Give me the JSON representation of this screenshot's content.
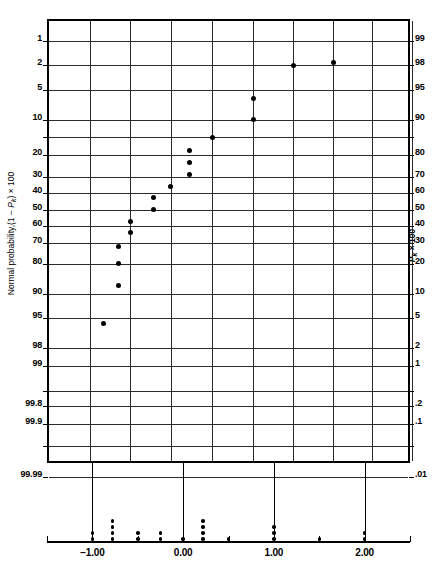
{
  "chart_data": {
    "type": "scatter",
    "title": "",
    "subtitle": "",
    "xlabel": "",
    "ylabel": "Normal probability,(1 − Pk) × 100",
    "ylabel_right": "Pk × 100",
    "grid": true,
    "legend": null,
    "xlim": [
      -1.5,
      2.5
    ],
    "x_ticks_major": [
      -1.0,
      0.0,
      1.0,
      2.0
    ],
    "x_ticks_major_labels": [
      "−1.00",
      "0.00",
      "1.00",
      "2.00"
    ],
    "x_ticks_minor": [
      -1.5,
      -0.5,
      0.5,
      1.5,
      2.5
    ],
    "y_axis_type": "normal-probability",
    "y_ticks_left": [
      "1",
      "2",
      "5",
      "10",
      "20",
      "30",
      "40",
      "50",
      "60",
      "70",
      "80",
      "90",
      "95",
      "98",
      "99",
      "99.8",
      "99.9",
      "99.99"
    ],
    "y_ticks_right": [
      "99",
      "98",
      "95",
      "90",
      "80",
      "70",
      "60",
      "50",
      "40",
      "30",
      "20",
      "10",
      "5",
      "2",
      "1",
      ".2",
      ".1",
      ".01"
    ],
    "points": [
      {
        "x": -1.15,
        "y_left": 97.0,
        "px": 101,
        "py": 321
      },
      {
        "x": -0.78,
        "y_left": 92.0,
        "px": 116,
        "py": 283
      },
      {
        "x": -0.78,
        "y_left": 85.0,
        "px": 116,
        "py": 261
      },
      {
        "x": -0.78,
        "y_left": 81.5,
        "px": 116,
        "py": 244
      },
      {
        "x": -0.5,
        "y_left": 77.0,
        "px": 128,
        "py": 230
      },
      {
        "x": -0.5,
        "y_left": 72.5,
        "px": 128,
        "py": 219
      },
      {
        "x": -0.36,
        "y_left": 69.0,
        "px": 151,
        "py": 207
      },
      {
        "x": -0.36,
        "y_left": 62.0,
        "px": 151,
        "py": 195
      },
      {
        "x": -0.22,
        "y_left": 55.0,
        "px": 168,
        "py": 184
      },
      {
        "x": 0.0,
        "y_left": 48.0,
        "px": 187,
        "py": 172
      },
      {
        "x": 0.18,
        "y_left": 41.0,
        "px": 187,
        "py": 160
      },
      {
        "x": 0.18,
        "y_left": 35.0,
        "px": 187,
        "py": 148
      },
      {
        "x": 0.3,
        "y_left": 28.0,
        "px": 210,
        "py": 135
      },
      {
        "x": 0.52,
        "y_left": 20.0,
        "px": 251,
        "py": 117
      },
      {
        "x": 1.0,
        "y_left": 13.0,
        "px": 251,
        "py": 96
      },
      {
        "x": 1.05,
        "y_left": 8.0,
        "px": 291,
        "py": 63
      },
      {
        "x": 1.5,
        "y_left": 3.5,
        "px": 331,
        "py": 60
      }
    ],
    "rug": {
      "description": "one-dimensional dot plot of the same sample on the horizontal axis",
      "stacks": [
        {
          "x": -1.0,
          "count": 2
        },
        {
          "x": -0.78,
          "count": 4
        },
        {
          "x": -0.5,
          "count": 2
        },
        {
          "x": -0.25,
          "count": 2
        },
        {
          "x": 0.0,
          "count": 1
        },
        {
          "x": 0.22,
          "count": 4
        },
        {
          "x": 0.5,
          "count": 1
        },
        {
          "x": 1.0,
          "count": 3
        },
        {
          "x": 1.5,
          "count": 1
        },
        {
          "x": 2.0,
          "count": 2
        }
      ]
    }
  },
  "axes": {
    "left_ticks": [
      {
        "label": "1",
        "py": 20
      },
      {
        "label": "2",
        "py": 44
      },
      {
        "label": "5",
        "py": 69
      },
      {
        "label": "10",
        "py": 99
      },
      {
        "label": "",
        "py": 116
      },
      {
        "label": "20",
        "py": 134
      },
      {
        "label": "30",
        "py": 156
      },
      {
        "label": "40",
        "py": 172
      },
      {
        "label": "50",
        "py": 189
      },
      {
        "label": "60",
        "py": 205
      },
      {
        "label": "70",
        "py": 222
      },
      {
        "label": "80",
        "py": 243
      },
      {
        "label": "90",
        "py": 273
      },
      {
        "label": "95",
        "py": 297
      },
      {
        "label": "98",
        "py": 327
      },
      {
        "label": "99",
        "py": 345
      },
      {
        "label": "",
        "py": 370
      },
      {
        "label": "99.8",
        "py": 385
      },
      {
        "label": "99.9",
        "py": 403
      },
      {
        "label": "",
        "py": 425
      },
      {
        "label": "99.99",
        "py": 456
      }
    ],
    "right_ticks": [
      {
        "label": "99",
        "py": 20
      },
      {
        "label": "98",
        "py": 44
      },
      {
        "label": "95",
        "py": 69
      },
      {
        "label": "90",
        "py": 99
      },
      {
        "label": "",
        "py": 116
      },
      {
        "label": "80",
        "py": 134
      },
      {
        "label": "70",
        "py": 156
      },
      {
        "label": "60",
        "py": 172
      },
      {
        "label": "50",
        "py": 189
      },
      {
        "label": "40",
        "py": 205
      },
      {
        "label": "30",
        "py": 222
      },
      {
        "label": "20",
        "py": 243
      },
      {
        "label": "10",
        "py": 273
      },
      {
        "label": "5",
        "py": 297
      },
      {
        "label": "2",
        "py": 327
      },
      {
        "label": "1",
        "py": 345
      },
      {
        "label": "",
        "py": 370
      },
      {
        "label": ".2",
        "py": 385
      },
      {
        "label": ".1",
        "py": 403
      },
      {
        "label": "",
        "py": 425
      },
      {
        "label": ".01",
        "py": 456
      }
    ],
    "vgrid_px": [
      41,
      81,
      122,
      163,
      204,
      244,
      284,
      323,
      363
    ],
    "x_major_px": [
      81,
      163,
      244,
      323
    ],
    "x_minor_px": [
      41,
      122,
      204,
      284,
      363
    ]
  },
  "colors": {
    "background": "#ffffff",
    "frame": "#000000",
    "grid": "#2a2a2a",
    "point": "#000000"
  }
}
